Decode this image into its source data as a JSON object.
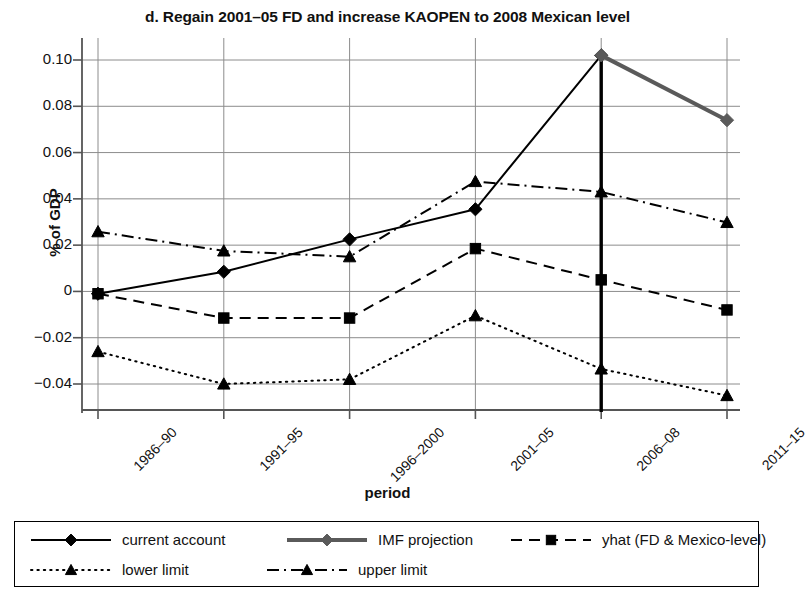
{
  "chart_data": {
    "type": "line",
    "title": "d. Regain 2001–05 FD and increase KAOPEN to 2008 Mexican level",
    "xlabel": "period",
    "ylabel": "% of GDP",
    "categories": [
      "1986–90",
      "1991–95",
      "1996–2000",
      "2001–05",
      "2006–08",
      "2011–15"
    ],
    "ylim": [
      -0.05,
      0.108
    ],
    "yticks": [
      0.1,
      0.08,
      0.06,
      0.04,
      0.02,
      0,
      -0.02,
      -0.04
    ],
    "ytick_labels": [
      "0.10",
      "0.08",
      "0.06",
      "0.04",
      "0.02",
      "0",
      "−0.02",
      "−0.04"
    ],
    "grid": true,
    "legend_position": "bottom",
    "series": [
      {
        "name": "current account",
        "style": "solid",
        "marker": "diamond",
        "color": "#000000",
        "width": 2,
        "values": [
          -0.001,
          0.0085,
          0.0225,
          0.0355,
          0.102,
          null
        ]
      },
      {
        "name": "IMF projection",
        "style": "solid",
        "marker": "diamond",
        "color": "#5a5a5a",
        "width": 4,
        "values": [
          null,
          null,
          null,
          null,
          0.102,
          0.074
        ]
      },
      {
        "name": "yhat (FD & Mexico-level)",
        "style": "dashed",
        "marker": "square",
        "color": "#000000",
        "width": 2,
        "values": [
          -0.001,
          -0.0115,
          -0.0115,
          0.0185,
          0.005,
          -0.008
        ]
      },
      {
        "name": "lower limit",
        "style": "dotted",
        "marker": "triangle",
        "color": "#000000",
        "width": 2,
        "values": [
          -0.026,
          -0.04,
          -0.038,
          -0.0105,
          -0.0335,
          -0.045
        ]
      },
      {
        "name": "upper limit",
        "style": "dashdot",
        "marker": "triangle",
        "color": "#000000",
        "width": 2,
        "values": [
          0.0258,
          0.0175,
          0.015,
          0.0475,
          0.043,
          0.0298
        ]
      }
    ],
    "annotations": [
      {
        "name": "projection-divider",
        "type": "vline",
        "category": "2006–08",
        "color": "#000000"
      }
    ]
  }
}
